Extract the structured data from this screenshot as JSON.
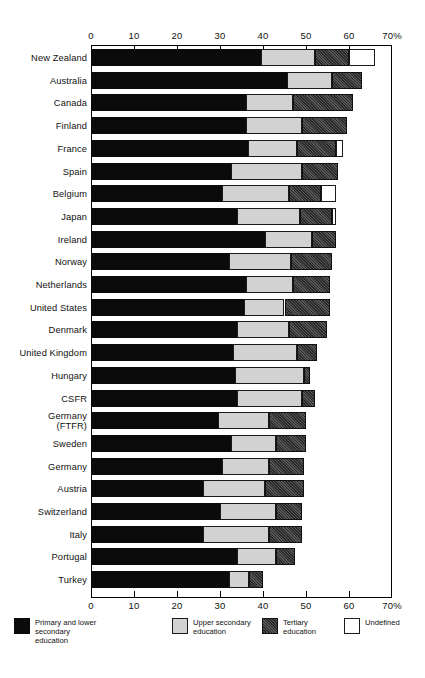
{
  "chart_data": {
    "type": "bar",
    "orientation": "horizontal",
    "stacked": true,
    "title": "",
    "xlabel": "",
    "ylabel": "",
    "xlim": [
      0,
      70
    ],
    "xticks": [
      0,
      10,
      20,
      30,
      40,
      50,
      60,
      70
    ],
    "xtick_labels": [
      "0",
      "10",
      "20",
      "30",
      "40",
      "50",
      "60",
      "70%"
    ],
    "axis_unit_suffix": "%",
    "grid": false,
    "legend_position": "bottom",
    "series": [
      {
        "name": "Primary and lower secondary education",
        "key": "primary",
        "color": "#0b0b0b"
      },
      {
        "name": "Upper secondary education",
        "key": "upper",
        "color": "#d2d2d2"
      },
      {
        "name": "Tertiary education",
        "key": "tertiary",
        "color": "#4a4a4a"
      },
      {
        "name": "Undefined",
        "key": "undefined",
        "color": "#ffffff"
      }
    ],
    "categories": [
      "New Zealand",
      "Australia",
      "Canada",
      "Finland",
      "France",
      "Spain",
      "Belgium",
      "Japan",
      "Ireland",
      "Norway",
      "Netherlands",
      "United States",
      "Denmark",
      "United Kingdom",
      "Hungary",
      "CSFR",
      "Germany\n(FTFR)",
      "Sweden",
      "Germany",
      "Austria",
      "Switzerland",
      "Italy",
      "Portugal",
      "Turkey"
    ],
    "rows": [
      {
        "category": "New Zealand",
        "primary": 39.5,
        "upper": 12.5,
        "tertiary": 8.0,
        "undefined": 6.0,
        "total": 66.0
      },
      {
        "category": "Australia",
        "primary": 45.5,
        "upper": 10.5,
        "tertiary": 7.0,
        "undefined": 0.0,
        "total": 63.0
      },
      {
        "category": "Canada",
        "primary": 36.0,
        "upper": 11.0,
        "tertiary": 14.0,
        "undefined": 0.0,
        "total": 61.0
      },
      {
        "category": "Finland",
        "primary": 36.0,
        "upper": 13.0,
        "tertiary": 10.5,
        "undefined": 0.0,
        "total": 59.5
      },
      {
        "category": "France",
        "primary": 36.5,
        "upper": 11.5,
        "tertiary": 9.0,
        "undefined": 1.5,
        "total": 58.5
      },
      {
        "category": "Spain",
        "primary": 32.5,
        "upper": 16.5,
        "tertiary": 8.5,
        "undefined": 0.0,
        "total": 57.5
      },
      {
        "category": "Belgium",
        "primary": 30.5,
        "upper": 15.5,
        "tertiary": 7.5,
        "undefined": 3.5,
        "total": 57.0
      },
      {
        "category": "Japan",
        "primary": 34.0,
        "upper": 14.5,
        "tertiary": 7.5,
        "undefined": 1.0,
        "total": 57.0
      },
      {
        "category": "Ireland",
        "primary": 40.5,
        "upper": 11.0,
        "tertiary": 5.5,
        "undefined": 0.0,
        "total": 57.0
      },
      {
        "category": "Norway",
        "primary": 32.0,
        "upper": 14.5,
        "tertiary": 9.5,
        "undefined": 0.0,
        "total": 56.0
      },
      {
        "category": "Netherlands",
        "primary": 36.0,
        "upper": 11.0,
        "tertiary": 8.5,
        "undefined": 0.0,
        "total": 55.5
      },
      {
        "category": "United States",
        "primary": 35.5,
        "upper": 9.5,
        "tertiary": 10.5,
        "undefined": 0.0,
        "total": 55.5
      },
      {
        "category": "Denmark",
        "primary": 34.0,
        "upper": 12.0,
        "tertiary": 9.0,
        "undefined": 0.0,
        "total": 55.0
      },
      {
        "category": "United Kingdom",
        "primary": 33.0,
        "upper": 15.0,
        "tertiary": 4.5,
        "undefined": 0.0,
        "total": 52.5
      },
      {
        "category": "Hungary",
        "primary": 33.5,
        "upper": 16.0,
        "tertiary": 1.5,
        "undefined": 0.0,
        "total": 51.0
      },
      {
        "category": "CSFR",
        "primary": 34.0,
        "upper": 15.0,
        "tertiary": 3.0,
        "undefined": 0.0,
        "total": 52.0
      },
      {
        "category": "Germany\n(FTFR)",
        "primary": 29.5,
        "upper": 12.0,
        "tertiary": 8.5,
        "undefined": 0.0,
        "total": 50.0
      },
      {
        "category": "Sweden",
        "primary": 32.5,
        "upper": 10.5,
        "tertiary": 7.0,
        "undefined": 0.0,
        "total": 50.0
      },
      {
        "category": "Germany",
        "primary": 30.5,
        "upper": 11.0,
        "tertiary": 8.0,
        "undefined": 0.0,
        "total": 49.5
      },
      {
        "category": "Austria",
        "primary": 26.0,
        "upper": 14.5,
        "tertiary": 9.0,
        "undefined": 0.0,
        "total": 49.5
      },
      {
        "category": "Switzerland",
        "primary": 30.0,
        "upper": 13.0,
        "tertiary": 6.0,
        "undefined": 0.0,
        "total": 49.0
      },
      {
        "category": "Italy",
        "primary": 26.0,
        "upper": 15.5,
        "tertiary": 7.5,
        "undefined": 0.0,
        "total": 49.0
      },
      {
        "category": "Portugal",
        "primary": 34.0,
        "upper": 9.0,
        "tertiary": 4.5,
        "undefined": 0.0,
        "total": 47.5
      },
      {
        "category": "Turkey",
        "primary": 32.0,
        "upper": 4.7,
        "tertiary": 3.3,
        "undefined": 0.0,
        "total": 40.0
      }
    ]
  },
  "legend": {
    "items": [
      {
        "label": "Primary and lower secondary education",
        "key": "primary"
      },
      {
        "label": "Upper secondary education",
        "key": "upper"
      },
      {
        "label": "Tertiary education",
        "key": "tertiary"
      },
      {
        "label": "Undefined",
        "key": "undefined"
      }
    ]
  }
}
